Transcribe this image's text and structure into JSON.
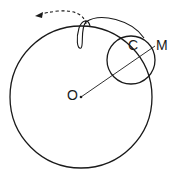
{
  "diagram": {
    "labels": {
      "center_big": "O",
      "center_small": "C",
      "point": "M"
    },
    "colors": {
      "stroke": "#1a1a1a",
      "background": "#ffffff"
    },
    "big_circle": {
      "cx": 81,
      "cy": 97,
      "r": 71
    },
    "small_circle": {
      "cx": 131,
      "cy": 60,
      "r": 24
    },
    "arrow": "dashed curved arrow indicating rotation direction"
  }
}
